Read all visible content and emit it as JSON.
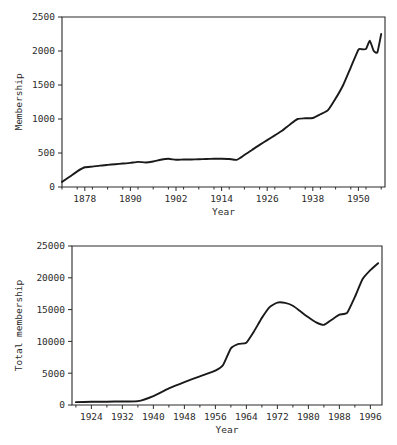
{
  "figure": {
    "background": "#ffffff",
    "line_color": "#1a1a1a",
    "axis_color": "#2b2b2b"
  },
  "chart_data": [
    {
      "id": "membership-chart",
      "type": "line",
      "title": "",
      "xlabel": "Year",
      "ylabel": "Membership",
      "xlim": [
        1872,
        1957
      ],
      "ylim": [
        0,
        2500
      ],
      "xticks": [
        1878,
        1890,
        1902,
        1914,
        1926,
        1938,
        1950
      ],
      "xticklabels": [
        "1878",
        "1890",
        "1902",
        "1914",
        "1926",
        "1938",
        "1950"
      ],
      "xminortick_step": 4,
      "yticks": [
        0,
        500,
        1000,
        1500,
        2000,
        2500
      ],
      "yticklabels": [
        "0",
        "500",
        "1000",
        "1500",
        "2000",
        "2500"
      ],
      "grid": false,
      "legend": false,
      "x": [
        1872,
        1874,
        1876,
        1878,
        1880,
        1882,
        1884,
        1886,
        1888,
        1890,
        1892,
        1894,
        1896,
        1898,
        1900,
        1902,
        1904,
        1906,
        1908,
        1910,
        1912,
        1914,
        1916,
        1918,
        1920,
        1922,
        1924,
        1926,
        1928,
        1930,
        1932,
        1934,
        1936,
        1938,
        1940,
        1942,
        1944,
        1946,
        1948,
        1950,
        1951,
        1952,
        1953,
        1954,
        1955,
        1956
      ],
      "values": [
        75,
        150,
        230,
        290,
        300,
        315,
        325,
        335,
        345,
        355,
        370,
        360,
        375,
        400,
        415,
        400,
        405,
        405,
        408,
        412,
        415,
        415,
        412,
        400,
        470,
        545,
        620,
        690,
        760,
        830,
        920,
        1000,
        1010,
        1015,
        1070,
        1130,
        1300,
        1500,
        1760,
        2020,
        2025,
        2030,
        2150,
        2005,
        1980,
        2250
      ]
    },
    {
      "id": "total-membership-chart",
      "type": "line",
      "title": "",
      "xlabel": "Year",
      "ylabel": "Total membership",
      "xlim": [
        1919,
        1999
      ],
      "ylim": [
        0,
        25000
      ],
      "xticks": [
        1924,
        1932,
        1940,
        1948,
        1956,
        1964,
        1972,
        1980,
        1988,
        1996
      ],
      "xticklabels": [
        "1924",
        "1932",
        "1940",
        "1948",
        "1956",
        "1964",
        "1972",
        "1980",
        "1988",
        "1996"
      ],
      "xminortick_step": 4,
      "yticks": [
        0,
        5000,
        10000,
        15000,
        20000,
        25000
      ],
      "yticklabels": [
        "0",
        "5000",
        "10000",
        "15000",
        "20000",
        "25000"
      ],
      "grid": false,
      "legend": false,
      "x": [
        1920,
        1924,
        1928,
        1932,
        1936,
        1940,
        1944,
        1948,
        1952,
        1956,
        1958,
        1960,
        1962,
        1964,
        1966,
        1968,
        1970,
        1972,
        1974,
        1976,
        1978,
        1980,
        1982,
        1984,
        1986,
        1988,
        1990,
        1992,
        1994,
        1996,
        1998
      ],
      "values": [
        450,
        500,
        520,
        560,
        600,
        1400,
        2600,
        3600,
        4500,
        5400,
        6300,
        8900,
        9600,
        9800,
        11600,
        13700,
        15400,
        16100,
        16050,
        15600,
        14700,
        13800,
        13000,
        12600,
        13400,
        14200,
        14500,
        17000,
        19800,
        21200,
        22300
      ]
    }
  ]
}
